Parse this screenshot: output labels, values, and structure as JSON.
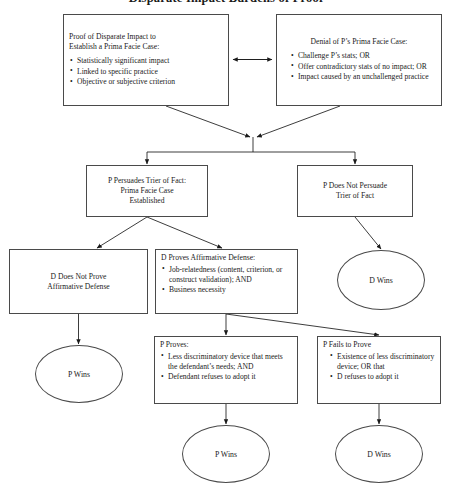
{
  "title": "Disparate Impact Burdens of Proof",
  "colors": {
    "stroke": "#4a4a4a",
    "arrow": "#1a1a1a",
    "background": "#ffffff",
    "text": "#1a1a1a"
  },
  "nodes": {
    "proof_disparate_impact": {
      "heading_line1": "Proof of Disparate Impact to",
      "heading_line2": "Establish a Prima Facie Case:",
      "bullets": [
        "Statistically significant impact",
        "Linked to specific practice",
        "Objective or subjective criterion"
      ]
    },
    "denial_prima_facie": {
      "heading": "Denial of P’s Prima Facie Case:",
      "bullets": [
        "Challenge P’s stats; OR",
        "Offer contradictory stats of no impact; OR",
        "Impact caused by an unchallenged practice"
      ]
    },
    "p_persuades": {
      "line1": "P Persuades Trier of Fact:",
      "line2": "Prima Facie Case",
      "line3": "Established"
    },
    "p_does_not_persuade": {
      "line1": "P Does Not Persuade",
      "line2": "Trier of Fact"
    },
    "d_does_not_prove": {
      "line1": "D Does Not Prove",
      "line2": "Affirmative Defense"
    },
    "d_proves_affirmative_defense": {
      "heading": "D Proves Affirmative Defense:",
      "bullets": [
        "Job-relatedness (content, criterion, or construct validation); AND",
        "Business necessity"
      ]
    },
    "p_proves": {
      "heading": "P Proves:",
      "bullets": [
        "Less discriminatory device that meets the defendant’s needs; AND",
        "Defendant refuses to adopt it"
      ]
    },
    "p_fails_to_prove": {
      "heading": "P Fails to Prove",
      "bullets": [
        "Existence of less discriminatory device; OR that",
        "D refuses to adopt it"
      ]
    },
    "d_wins_right": {
      "label": "D Wins"
    },
    "p_wins_left": {
      "label": "P Wins"
    },
    "p_wins_bottom": {
      "label": "P Wins"
    },
    "d_wins_bottom": {
      "label": "D Wins"
    }
  }
}
